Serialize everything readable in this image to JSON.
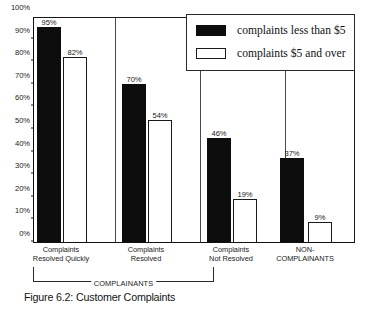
{
  "chart_data": {
    "type": "bar",
    "title": "",
    "caption": "Figure 6.2: Customer Complaints",
    "xlabel": "",
    "ylabel": "",
    "ylim": [
      0,
      100
    ],
    "grid": false,
    "legend_position": "top-right",
    "categories": [
      "Complaints\nResolved Quickly",
      "Complaints\nResolved",
      "Complaints\nNot Resolved",
      "NON-\nCOMPLAINANTS"
    ],
    "series": [
      {
        "name": "complaints less than $5",
        "style": "filled",
        "color": "#0d0d0d",
        "values": [
          95,
          70,
          46,
          37
        ],
        "value_labels": [
          "95%",
          "70%",
          "46%",
          "37%"
        ]
      },
      {
        "name": "complaints $5 and over",
        "style": "hollow",
        "color": "#ffffff",
        "values": [
          82,
          54,
          19,
          9
        ],
        "value_labels": [
          "82%",
          "54%",
          "19%",
          "9%"
        ]
      }
    ],
    "yticks": [
      0,
      10,
      20,
      30,
      40,
      50,
      60,
      70,
      80,
      90,
      100
    ],
    "ytick_labels": [
      "0%",
      "10%",
      "20%",
      "30%",
      "40%",
      "50%",
      "60%",
      "70%",
      "80%",
      "90%",
      "100%"
    ],
    "annotations": [
      {
        "name": "complainants-bracket",
        "text": "COMPLAINANTS",
        "spans_categories": [
          0,
          2
        ]
      }
    ]
  },
  "legend": {
    "items": [
      {
        "label": "complaints less than $5",
        "swatch": "filled"
      },
      {
        "label": "complaints $5 and over",
        "swatch": "hollow"
      }
    ]
  }
}
